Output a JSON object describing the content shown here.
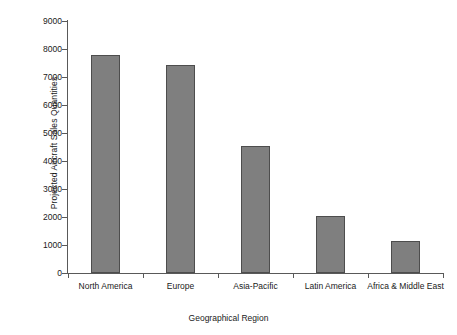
{
  "chart_data": {
    "type": "bar",
    "title": "",
    "xlabel": "Geographical Region",
    "ylabel": "Projected Aircraft Sales Quantities",
    "categories": [
      "North America",
      "Europe",
      "Asia-Pacific",
      "Latin America",
      "Africa & Middle East"
    ],
    "values": [
      7800,
      7430,
      4550,
      2050,
      1150
    ],
    "ylim": [
      0,
      9000
    ],
    "ytick_labels": [
      "9000",
      "8000",
      "7000",
      "6000",
      "5000",
      "4000",
      "3000",
      "2000",
      "1000",
      "0"
    ],
    "ytick_values": [
      9000,
      8000,
      7000,
      6000,
      5000,
      4000,
      3000,
      2000,
      1000,
      0
    ],
    "grid": false,
    "legend": false,
    "bar_color": "#7f7f7f",
    "bar_border_color": "#4d4d4d",
    "axis_color": "#595959",
    "background": "#ffffff"
  },
  "axis": {
    "y_title": "Projected Aircraft Sales Quantities",
    "x_title": "Geographical Region"
  }
}
